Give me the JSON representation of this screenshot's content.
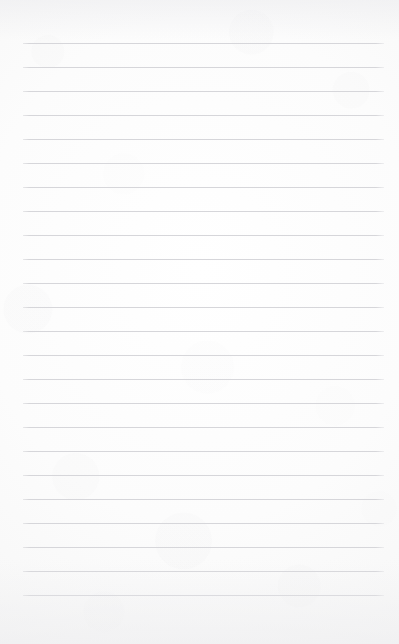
{
  "document": {
    "type": "lined-notepad-page",
    "title": "",
    "body_text": "",
    "is_blank": true,
    "page_width": 399,
    "page_height": 644
  },
  "paper": {
    "background_color": "#fcfcfc",
    "edge_tint_color": "#f4f4f5",
    "bottom_shade_color": "#ececee"
  },
  "ruling": {
    "line_color": "#d6d6da",
    "line_thickness_px": 1,
    "line_count": 24,
    "first_line_y": 43,
    "line_spacing_px": 24,
    "left_margin_x": 23,
    "right_margin_x": 384,
    "line_width_px": 361,
    "lines": [
      {
        "index": 1,
        "y": 43
      },
      {
        "index": 2,
        "y": 67
      },
      {
        "index": 3,
        "y": 91
      },
      {
        "index": 4,
        "y": 115
      },
      {
        "index": 5,
        "y": 139
      },
      {
        "index": 6,
        "y": 163
      },
      {
        "index": 7,
        "y": 187
      },
      {
        "index": 8,
        "y": 211
      },
      {
        "index": 9,
        "y": 235
      },
      {
        "index": 10,
        "y": 259
      },
      {
        "index": 11,
        "y": 283
      },
      {
        "index": 12,
        "y": 307
      },
      {
        "index": 13,
        "y": 331
      },
      {
        "index": 14,
        "y": 355
      },
      {
        "index": 15,
        "y": 379
      },
      {
        "index": 16,
        "y": 403
      },
      {
        "index": 17,
        "y": 427
      },
      {
        "index": 18,
        "y": 451
      },
      {
        "index": 19,
        "y": 475
      },
      {
        "index": 20,
        "y": 499
      },
      {
        "index": 21,
        "y": 523
      },
      {
        "index": 22,
        "y": 547
      },
      {
        "index": 23,
        "y": 571
      },
      {
        "index": 24,
        "y": 595
      }
    ]
  }
}
